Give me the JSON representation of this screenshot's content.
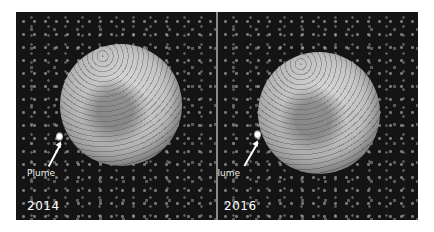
{
  "image": {
    "description": "Side-by-side comparison of a moon disk against a star/noise background, with a labeled plume on the lower-left limb",
    "panels": [
      {
        "year": "2014",
        "annotation": "Plume"
      },
      {
        "year": "2016",
        "annotation": "Plume"
      }
    ],
    "colors": {
      "background": "#141414",
      "disk": "#bdbdbd",
      "label": "#ffffff",
      "divider": "#8a8a8a"
    }
  }
}
